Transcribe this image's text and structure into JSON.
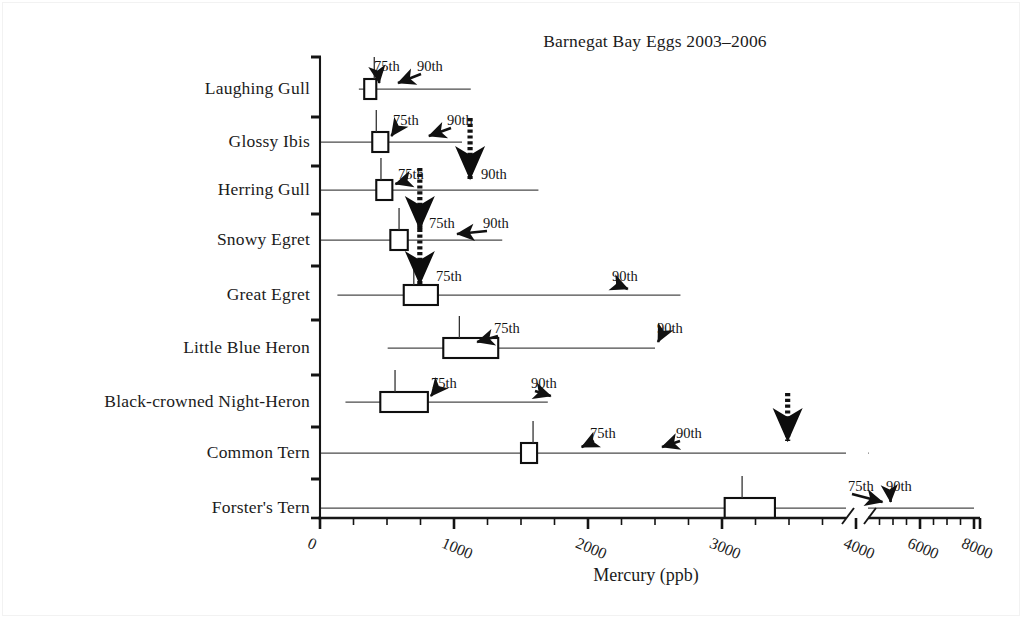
{
  "chart_data": {
    "type": "box",
    "title": "Barnegat Bay Eggs 2003–2006",
    "xlabel": "Mercury (ppb)",
    "ylabel": "",
    "xlim": [
      0,
      8000
    ],
    "xticks": [
      0,
      1000,
      2000,
      3000,
      4000,
      6000,
      8000
    ],
    "xtick_labels": [
      "0",
      "1000",
      "2000",
      "3000",
      "4000",
      "6000",
      "8000"
    ],
    "axis_break": {
      "after": 4000,
      "note": "axis break between 4000 and next tick"
    },
    "grid": false,
    "legend": null,
    "annotation_labels": [
      "75th",
      "90th"
    ],
    "categories": [
      "Laughing Gull",
      "Glossy Ibis",
      "Herring Gull",
      "Snowy Egret",
      "Great Egret",
      "Little Blue Heron",
      "Black-crowned Night-Heron",
      "Common Tern",
      "Forster's Tern"
    ],
    "series": [
      {
        "name": "Laughing Gull",
        "whisker_low": 290,
        "q1": 330,
        "median": 405,
        "q3": 420,
        "whisker_high": 1125,
        "p75": 420,
        "p90": 560,
        "p90_offscale": false,
        "annotations": [
          {
            "label": "75th",
            "target_value": 420,
            "style": "thin-arrow"
          },
          {
            "label": "90th",
            "target_value": 560,
            "style": "thin-arrow"
          }
        ]
      },
      {
        "name": "Glossy Ibis",
        "whisker_low": 0,
        "q1": 390,
        "median": 420,
        "q3": 510,
        "whisker_high": 1060,
        "p75": 510,
        "p90": 790,
        "p90_offscale": false,
        "annotations": [
          {
            "label": "75th",
            "target_value": 510,
            "style": "thin-arrow"
          },
          {
            "label": "90th",
            "target_value": 790,
            "style": "thin-arrow"
          }
        ]
      },
      {
        "name": "Herring Gull",
        "whisker_low": 0,
        "q1": 420,
        "median": 455,
        "q3": 540,
        "whisker_high": 1630,
        "p75": 540,
        "p90": 1120,
        "p90_offscale": true,
        "annotations": [
          {
            "label": "75th",
            "target_value": 540,
            "style": "thin-arrow"
          },
          {
            "label": "90th",
            "target_value": 1120,
            "style": "thick-dashed-arrow"
          }
        ]
      },
      {
        "name": "Snowy Egret",
        "whisker_low": 0,
        "q1": 525,
        "median": 590,
        "q3": 655,
        "whisker_high": 1360,
        "p75": 745,
        "p90": 1000,
        "p90_offscale": false,
        "annotations": [
          {
            "label": "75th",
            "target_value": 745,
            "style": "thick-dashed-arrow"
          },
          {
            "label": "90th",
            "target_value": 1000,
            "style": "thin-arrow"
          }
        ]
      },
      {
        "name": "Great Egret",
        "whisker_low": 130,
        "q1": 625,
        "median": 700,
        "q3": 880,
        "whisker_high": 2690,
        "p75": 745,
        "p90": 2275,
        "p90_offscale": false,
        "annotations": [
          {
            "label": "75th",
            "target_value": 745,
            "style": "thick-dashed-arrow"
          },
          {
            "label": "90th",
            "target_value": 2275,
            "style": "thin-arrow"
          }
        ]
      },
      {
        "name": "Little Blue Heron",
        "whisker_low": 505,
        "q1": 920,
        "median": 1040,
        "q3": 1330,
        "whisker_high": 2500,
        "p75": 1150,
        "p90": 2500,
        "p90_offscale": false,
        "annotations": [
          {
            "label": "75th",
            "target_value": 1150,
            "style": "thin-arrow"
          },
          {
            "label": "90th",
            "target_value": 2500,
            "style": "thin-arrow"
          }
        ]
      },
      {
        "name": "Black-crowned Night-Heron",
        "whisker_low": 190,
        "q1": 450,
        "median": 560,
        "q3": 805,
        "whisker_high": 1700,
        "p75": 805,
        "p90": 1700,
        "p90_offscale": false,
        "annotations": [
          {
            "label": "75th",
            "target_value": 805,
            "style": "thin-arrow"
          },
          {
            "label": "90th",
            "target_value": 1700,
            "style": "thin-arrow"
          }
        ]
      },
      {
        "name": "Common Tern",
        "whisker_low": 0,
        "q1": 1500,
        "median": 1590,
        "q3": 1620,
        "whisker_high": 4100,
        "p75": 1930,
        "p90": 2530,
        "p90_offscale": true,
        "annotations": [
          {
            "label": "75th",
            "target_value": 1930,
            "style": "thin-arrow"
          },
          {
            "label": "90th",
            "target_value": 2530,
            "style": "thin-arrow"
          },
          {
            "label": "",
            "target_value": 3490,
            "style": "thick-dashed-arrow"
          }
        ]
      },
      {
        "name": "Forster's Tern",
        "whisker_low": 0,
        "q1": 3020,
        "median": 3150,
        "q3": 3395,
        "whisker_high": 8000,
        "p75": 4500,
        "p90": 4800,
        "p90_offscale": true,
        "annotations": [
          {
            "label": "75th",
            "target_value": 4500,
            "style": "thin-arrow"
          },
          {
            "label": "90th",
            "target_value": 4800,
            "style": "thin-arrow"
          }
        ]
      }
    ]
  }
}
